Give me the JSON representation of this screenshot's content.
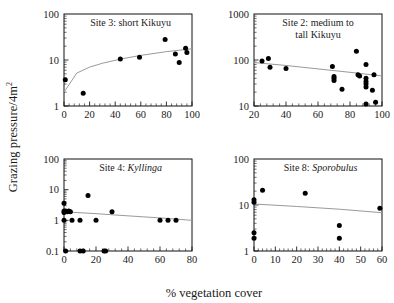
{
  "figure": {
    "ylabel": "Grazing pressure/4m",
    "ylabel_sup": "2",
    "xlabel": "% vegetation cover"
  },
  "chart_data": [
    {
      "type": "scatter",
      "panel_id": "site-3",
      "title": "Site 3: short Kikuyu",
      "title_plain": "Site 3: short Kikuyu",
      "xlabel": "% vegetation cover",
      "ylabel": "Grazing pressure/4m2",
      "xscale": "linear",
      "yscale": "log",
      "xlim": [
        0,
        100
      ],
      "ylim": [
        1,
        100
      ],
      "xticks": [
        0,
        20,
        40,
        60,
        80,
        100
      ],
      "xticklabels": [
        "0",
        "20",
        "40",
        "60",
        "80",
        "100"
      ],
      "yticks": [
        1,
        10,
        100
      ],
      "yticklabels": [
        "1",
        "10",
        "100"
      ],
      "grid": false,
      "legend": "none",
      "points": [
        {
          "x": 1,
          "y": 3.7
        },
        {
          "x": 15,
          "y": 1.9
        },
        {
          "x": 44,
          "y": 10.5
        },
        {
          "x": 59,
          "y": 11.5
        },
        {
          "x": 79,
          "y": 28
        },
        {
          "x": 87,
          "y": 13.5
        },
        {
          "x": 90,
          "y": 8.8
        },
        {
          "x": 95,
          "y": 18
        },
        {
          "x": 96,
          "y": 14.5
        }
      ],
      "fit": {
        "description": "increasing log-curve fit",
        "points": [
          [
            0,
            2.0
          ],
          [
            10,
            5.2
          ],
          [
            20,
            7.0
          ],
          [
            30,
            8.5
          ],
          [
            45,
            10.6
          ],
          [
            60,
            12.6
          ],
          [
            80,
            15.2
          ],
          [
            100,
            17.5
          ]
        ]
      }
    },
    {
      "type": "scatter",
      "panel_id": "site-2",
      "title": "Site 2: medium to tall Kikuyu",
      "title_line1": "Site 2: medium to",
      "title_line2": "tall Kikuyu",
      "xlabel": "% vegetation cover",
      "ylabel": "Grazing pressure/4m2",
      "xscale": "linear",
      "yscale": "log",
      "xlim": [
        20,
        100
      ],
      "ylim": [
        10,
        1000
      ],
      "xticks": [
        20,
        40,
        60,
        80,
        100
      ],
      "xticklabels": [
        "20",
        "40",
        "60",
        "80",
        "100"
      ],
      "yticks": [
        10,
        100,
        1000
      ],
      "yticklabels": [
        "10",
        "100",
        "1000"
      ],
      "grid": false,
      "legend": "none",
      "points": [
        {
          "x": 25,
          "y": 95
        },
        {
          "x": 29,
          "y": 108
        },
        {
          "x": 30,
          "y": 70
        },
        {
          "x": 40,
          "y": 65
        },
        {
          "x": 69,
          "y": 72
        },
        {
          "x": 70,
          "y": 44
        },
        {
          "x": 70,
          "y": 40
        },
        {
          "x": 70,
          "y": 36
        },
        {
          "x": 75,
          "y": 23
        },
        {
          "x": 84,
          "y": 155
        },
        {
          "x": 85,
          "y": 48
        },
        {
          "x": 86,
          "y": 45
        },
        {
          "x": 90,
          "y": 80
        },
        {
          "x": 90,
          "y": 40
        },
        {
          "x": 90,
          "y": 34
        },
        {
          "x": 90,
          "y": 30
        },
        {
          "x": 90,
          "y": 26
        },
        {
          "x": 90,
          "y": 11
        },
        {
          "x": 94,
          "y": 22
        },
        {
          "x": 95,
          "y": 48
        },
        {
          "x": 96,
          "y": 12
        }
      ],
      "fit": {
        "description": "gently declining fit",
        "points": [
          [
            20,
            88
          ],
          [
            40,
            76
          ],
          [
            60,
            64
          ],
          [
            80,
            54
          ],
          [
            100,
            45
          ]
        ]
      }
    },
    {
      "type": "scatter",
      "panel_id": "site-4",
      "title": "Site 4: Kyllinga",
      "title_prefix": "Site 4: ",
      "title_italic": "Kyllinga",
      "xlabel": "% vegetation cover",
      "ylabel": "Grazing pressure/4m2",
      "xscale": "linear",
      "yscale": "log",
      "xlim": [
        0,
        80
      ],
      "ylim": [
        0.1,
        100
      ],
      "xticks": [
        0,
        20,
        40,
        60,
        80
      ],
      "xticklabels": [
        "0",
        "20",
        "40",
        "60",
        "80"
      ],
      "yticks": [
        0.1,
        1,
        10,
        100
      ],
      "yticklabels": [
        "0.1",
        "1",
        "10",
        "100"
      ],
      "grid": false,
      "legend": "none",
      "points": [
        {
          "x": 0,
          "y": 3.6
        },
        {
          "x": 0,
          "y": 2.0
        },
        {
          "x": 0,
          "y": 1.8
        },
        {
          "x": 0,
          "y": 1.0
        },
        {
          "x": 1,
          "y": 2.0
        },
        {
          "x": 2,
          "y": 1.9
        },
        {
          "x": 3,
          "y": 2.0
        },
        {
          "x": 4,
          "y": 1.9
        },
        {
          "x": 5,
          "y": 1.0
        },
        {
          "x": 10,
          "y": 1.0
        },
        {
          "x": 15,
          "y": 6.5
        },
        {
          "x": 20,
          "y": 1.0
        },
        {
          "x": 30,
          "y": 1.9
        },
        {
          "x": 60,
          "y": 1.0
        },
        {
          "x": 65,
          "y": 1.0
        },
        {
          "x": 70,
          "y": 1.0
        },
        {
          "x": 1,
          "y": 0.1
        },
        {
          "x": 10,
          "y": 0.1
        },
        {
          "x": 12,
          "y": 0.1
        },
        {
          "x": 25,
          "y": 0.1
        },
        {
          "x": 26,
          "y": 0.1
        }
      ],
      "fit": {
        "description": "nearly flat slight decline",
        "points": [
          [
            0,
            1.9
          ],
          [
            20,
            1.65
          ],
          [
            40,
            1.4
          ],
          [
            60,
            1.2
          ],
          [
            80,
            1.0
          ]
        ]
      }
    },
    {
      "type": "scatter",
      "panel_id": "site-8",
      "title": "Site 8: Sporobulus",
      "title_prefix": "Site 8: ",
      "title_italic": "Sporobulus",
      "xlabel": "% vegetation cover",
      "ylabel": "Grazing pressure/4m2",
      "xscale": "linear",
      "yscale": "log",
      "xlim": [
        0,
        60
      ],
      "ylim": [
        1,
        100
      ],
      "xticks": [
        0,
        10,
        20,
        30,
        40,
        50,
        60
      ],
      "xticklabels": [
        "0",
        "10",
        "20",
        "30",
        "40",
        "50",
        "60"
      ],
      "yticks": [
        1,
        10,
        100
      ],
      "yticklabels": [
        "1",
        "10",
        "100"
      ],
      "grid": false,
      "legend": "none",
      "points": [
        {
          "x": 0,
          "y": 13
        },
        {
          "x": 0,
          "y": 11.5
        },
        {
          "x": 0,
          "y": 2.5
        },
        {
          "x": 0,
          "y": 1.9
        },
        {
          "x": 4,
          "y": 21
        },
        {
          "x": 24,
          "y": 18
        },
        {
          "x": 40,
          "y": 3.6
        },
        {
          "x": 40,
          "y": 1.9
        },
        {
          "x": 59,
          "y": 8.5
        }
      ],
      "fit": {
        "description": "slight decline",
        "points": [
          [
            0,
            10.5
          ],
          [
            20,
            9.3
          ],
          [
            40,
            8.1
          ],
          [
            60,
            6.8
          ]
        ]
      }
    }
  ]
}
